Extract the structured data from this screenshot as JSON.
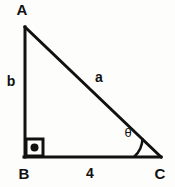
{
  "figure": {
    "type": "right-triangle-diagram",
    "background_color": "#fdfdfc",
    "stroke_color": "#111111",
    "stroke_width": 3,
    "vertices": {
      "A": {
        "label": "A",
        "x": 25,
        "y": 27,
        "label_x": 22,
        "label_y": 11
      },
      "B": {
        "label": "B",
        "x": 25,
        "y": 157,
        "label_x": 24,
        "label_y": 175
      },
      "C": {
        "label": "C",
        "x": 160,
        "y": 157,
        "label_x": 160,
        "label_y": 175
      }
    },
    "sides": {
      "vertical_leg": {
        "label": "b",
        "label_x": 11,
        "label_y": 82,
        "from": "A",
        "to": "B"
      },
      "hypotenuse": {
        "label": "a",
        "label_x": 99,
        "label_y": 78,
        "from": "A",
        "to": "C"
      },
      "base": {
        "label": "4",
        "label_x": 90,
        "label_y": 174,
        "from": "B",
        "to": "C"
      }
    },
    "angles": {
      "right_angle": {
        "at": "B",
        "marker": "square-with-dot",
        "square_x": 25,
        "square_y": 139,
        "square_size": 18,
        "dot_radius": 4
      },
      "theta": {
        "at": "C",
        "label": "θ",
        "label_x": 128,
        "label_y": 134,
        "arc_radius": 26
      }
    }
  }
}
